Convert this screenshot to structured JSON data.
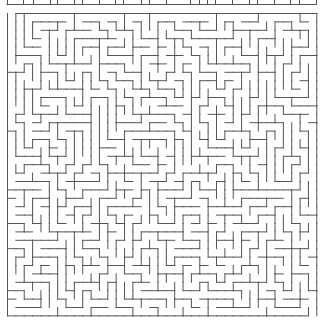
{
  "puzzle": {
    "type": "maze",
    "wall_color": "#555555",
    "background_color": "#ffffff",
    "wall_width": 1,
    "previous_maze_strip": {
      "y_line": 4.5,
      "x_start": 7,
      "x_end": 316,
      "tick_xs": [
        7,
        23,
        33,
        50,
        57,
        74,
        82,
        99,
        115,
        123,
        141,
        149,
        166,
        190,
        199,
        207,
        215,
        232,
        249,
        257,
        274,
        290,
        299,
        316
      ]
    },
    "grid": {
      "origin_x": 7.5,
      "origin_y": 13.5,
      "cols": 37,
      "rows": 36,
      "cell_w": 8.36,
      "cell_h": 8.4,
      "seed": 20240517,
      "entrance": {
        "side": "top",
        "col": 0
      },
      "exit": {
        "side": "bottom",
        "col": 36
      }
    }
  }
}
